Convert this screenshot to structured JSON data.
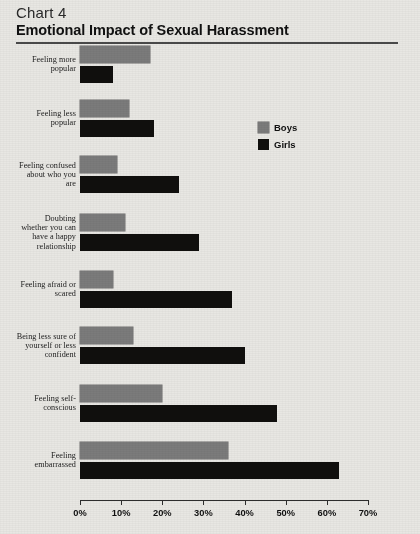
{
  "header": {
    "chart_number": "Chart 4",
    "title": "Emotional Impact of Sexual Harassment"
  },
  "legend": {
    "items": [
      {
        "label": "Boys",
        "color": "#7b7b7b",
        "name": "legend-item-boys"
      },
      {
        "label": "Girls",
        "color": "#100f0d",
        "name": "legend-item-girls"
      }
    ]
  },
  "axis": {
    "ticks": [
      "0%",
      "10%",
      "20%",
      "30%",
      "40%",
      "50%",
      "60%",
      "70%"
    ]
  },
  "chart_data": {
    "type": "bar",
    "orientation": "horizontal",
    "title": "Emotional Impact of Sexual Harassment",
    "subtitle": "Chart 4",
    "xlabel": "",
    "ylabel": "",
    "xlim": [
      0,
      70
    ],
    "xunit": "%",
    "xticks": [
      0,
      10,
      20,
      30,
      40,
      50,
      60,
      70
    ],
    "grid": false,
    "legend_position": "upper-right-inside",
    "categories": [
      "Feeling more popular",
      "Feeling less popular",
      "Feeling confused about who you are",
      "Doubting whether you can have a happy relationship",
      "Feeling afraid or scared",
      "Being less sure of yourself or less confident",
      "Feeling self-conscious",
      "Feeling embarrassed"
    ],
    "category_label_lines": [
      [
        "Feeling more",
        "popular"
      ],
      [
        "Feeling less",
        "popular"
      ],
      [
        "Feeling confused",
        "about who you",
        "are"
      ],
      [
        "Doubting",
        "whether you can",
        "have a happy",
        "relationship"
      ],
      [
        "Feeling afraid or",
        "scared"
      ],
      [
        "Being less sure of",
        "yourself or less",
        "confident"
      ],
      [
        "Feeling self-",
        "conscious"
      ],
      [
        "Feeling",
        "embarrassed"
      ]
    ],
    "series": [
      {
        "name": "Boys",
        "color": "#7b7b7b",
        "values": [
          17,
          12,
          9,
          11,
          8,
          13,
          20,
          36
        ]
      },
      {
        "name": "Girls",
        "color": "#100f0d",
        "values": [
          8,
          18,
          24,
          29,
          37,
          40,
          48,
          63
        ]
      }
    ]
  }
}
